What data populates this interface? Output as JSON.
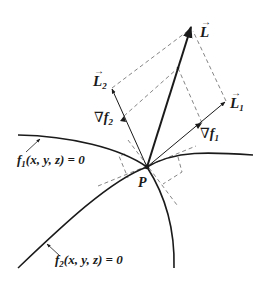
{
  "diagram": {
    "colors": {
      "background": "#ffffff",
      "ink": "#1a1a1a",
      "dashed": "#777777"
    },
    "point": {
      "label": "P",
      "x": 147,
      "y": 167
    },
    "vectors": [
      {
        "id": "L",
        "label": "L",
        "sub": "",
        "tip": [
          191,
          25
        ],
        "style": "thick"
      },
      {
        "id": "L1",
        "label": "L",
        "sub": "1",
        "tip": [
          226,
          101
        ],
        "style": "thin"
      },
      {
        "id": "L2",
        "label": "L",
        "sub": "2",
        "tip": [
          112,
          88
        ],
        "style": "thin"
      },
      {
        "id": "grad_f1",
        "label": "∇f",
        "sub": "1",
        "tip": [
          202,
          123
        ]
      },
      {
        "id": "grad_f2",
        "label": "∇f",
        "sub": "2",
        "tip": [
          124,
          116
        ]
      }
    ],
    "curves": [
      {
        "id": "f1",
        "label_main": "f",
        "label_sub": "1",
        "label_rest": "(x, y, z) = 0"
      },
      {
        "id": "f2",
        "label_main": "f",
        "label_sub": "2",
        "label_rest": "(x, y, z) = 0"
      }
    ],
    "labels": {
      "L": "L",
      "L1_main": "L",
      "L1_sub": "1",
      "L2_main": "L",
      "L2_sub": "2",
      "grad_symbol": "∇",
      "grad_f1_main": "f",
      "grad_f1_sub": "1",
      "grad_f2_main": "f",
      "grad_f2_sub": "2",
      "vec_arrow": "→",
      "P": "P",
      "f1_main": "f",
      "f1_sub": "1",
      "f1_rest": "(x, y, z) = 0",
      "f2_main": "f",
      "f2_sub": "2",
      "f2_rest": "(x, y, z) = 0"
    }
  }
}
